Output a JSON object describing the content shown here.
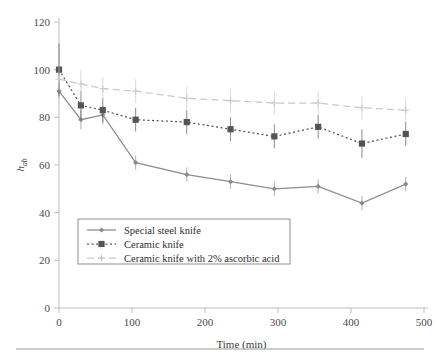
{
  "figure": {
    "background": "#ffffff",
    "rule_color": "#9a9a9a"
  },
  "axes": {
    "x_title": "Time (min)",
    "y_title_main": "h",
    "y_title_sub": "ab",
    "x_ticks": [
      "0",
      "100",
      "200",
      "300",
      "400",
      "500"
    ],
    "y_ticks": [
      "0",
      "20",
      "40",
      "60",
      "80",
      "100",
      "120"
    ]
  },
  "legend": {
    "items": [
      {
        "label": "Special steel knife",
        "color": "#8c8c8c",
        "style": "solid",
        "marker": "diamond"
      },
      {
        "label": "Ceramic knife",
        "color": "#545454",
        "style": "dotted",
        "marker": "square"
      },
      {
        "label": "Ceramic knife with 2% ascorbic acid",
        "color": "#c9c9c9",
        "style": "dashed",
        "marker": "plus"
      }
    ]
  },
  "chart_data": {
    "type": "line",
    "title": "",
    "xlabel": "Time (min)",
    "ylabel": "h_ab",
    "xlim": [
      0,
      500
    ],
    "ylim": [
      0,
      120
    ],
    "xticks": [
      0,
      100,
      200,
      300,
      400,
      500
    ],
    "yticks": [
      0,
      20,
      40,
      60,
      80,
      100,
      120
    ],
    "grid": false,
    "legend_position": "lower-left-inside",
    "x": [
      0,
      30,
      60,
      105,
      175,
      235,
      295,
      355,
      415,
      475
    ],
    "series": [
      {
        "name": "Special steel knife",
        "color": "#8c8c8c",
        "linestyle": "solid",
        "marker": "diamond",
        "values": [
          91,
          79,
          81,
          61,
          56,
          53,
          50,
          51,
          44,
          52
        ],
        "errors": [
          3,
          4,
          4,
          3,
          3,
          3,
          3,
          3,
          3,
          3
        ]
      },
      {
        "name": "Ceramic knife",
        "color": "#545454",
        "linestyle": "dotted",
        "marker": "square",
        "values": [
          100,
          85,
          83,
          79,
          78,
          75,
          72,
          76,
          69,
          73
        ],
        "errors": [
          11,
          6,
          5,
          5,
          5,
          5,
          5,
          5,
          6,
          5
        ]
      },
      {
        "name": "Ceramic knife with 2% ascorbic acid",
        "color": "#c9c9c9",
        "linestyle": "dashed",
        "marker": "plus",
        "values": [
          96,
          94,
          92,
          91,
          88,
          87,
          86,
          86,
          84,
          83
        ],
        "errors": [
          5,
          6,
          5,
          5,
          5,
          5,
          5,
          5,
          5,
          5
        ]
      }
    ]
  }
}
